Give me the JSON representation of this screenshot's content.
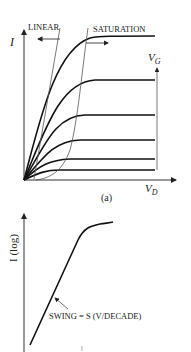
{
  "figure_a": {
    "y_axis_label": "I",
    "x_axis_label": "V",
    "x_axis_label_sub": "D",
    "param_label": "V",
    "param_label_sub": "G",
    "region_linear": "LINEAR",
    "region_saturation": "SATURATION",
    "caption": "(a)",
    "curve_count": 6
  },
  "figure_b": {
    "y_axis_label": "I (log)",
    "annotation": "SWING = S (V/DECADE)"
  },
  "colors": {
    "ink": "#111111",
    "thin_line": "#555555",
    "background": "#ffffff"
  }
}
